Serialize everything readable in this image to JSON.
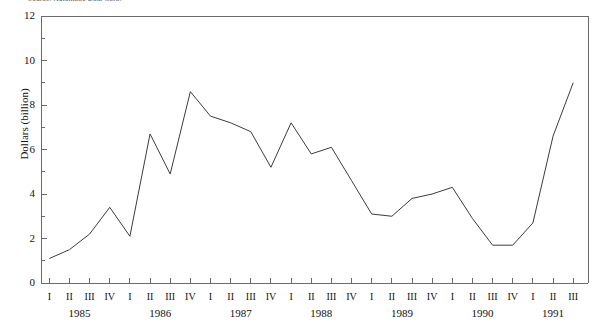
{
  "source_note": "Source: Automatic Data Corp.",
  "chart_data": {
    "type": "line",
    "title": "",
    "xlabel": "",
    "ylabel": "Dollars (billion)",
    "ylim": [
      0,
      12
    ],
    "y_ticks": [
      0,
      2,
      4,
      6,
      8,
      10,
      12
    ],
    "y_tick_labels": [
      "0",
      "2",
      "4",
      "6",
      "8",
      "10",
      "12"
    ],
    "y_minor_ticks": [
      1,
      3,
      5,
      7,
      9,
      11
    ],
    "grid": false,
    "legend": "none",
    "categories": [
      "1985 I",
      "1985 II",
      "1985 III",
      "1985 IV",
      "1986 I",
      "1986 II",
      "1986 III",
      "1986 IV",
      "1987 I",
      "1987 II",
      "1987 III",
      "1987 IV",
      "1988 I",
      "1988 II",
      "1988 III",
      "1988 IV",
      "1989 I",
      "1989 II",
      "1989 III",
      "1989 IV",
      "1990 I",
      "1990 II",
      "1990 III",
      "1990 IV",
      "1991 I",
      "1991 II",
      "1991 III"
    ],
    "quarter_labels": [
      "I",
      "II",
      "III",
      "IV",
      "I",
      "II",
      "III",
      "IV",
      "I",
      "II",
      "III",
      "IV",
      "I",
      "II",
      "III",
      "IV",
      "I",
      "II",
      "III",
      "IV",
      "I",
      "II",
      "III",
      "IV",
      "I",
      "II",
      "III"
    ],
    "year_labels": [
      "1985",
      "1986",
      "1987",
      "1988",
      "1989",
      "1990",
      "1991"
    ],
    "year_group_sizes": [
      4,
      4,
      4,
      4,
      4,
      4,
      3
    ],
    "values": [
      1.1,
      1.5,
      2.2,
      3.4,
      2.1,
      6.7,
      4.9,
      8.6,
      7.5,
      7.2,
      6.8,
      5.2,
      7.2,
      5.8,
      6.1,
      4.6,
      3.1,
      3.0,
      3.8,
      4.0,
      4.3,
      2.9,
      1.7,
      1.7,
      2.7,
      6.6,
      9.0
    ],
    "line_color": "#3c3c3c",
    "axis_color": "#6a6a6a"
  }
}
